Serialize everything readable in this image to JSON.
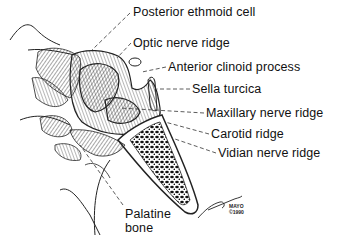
{
  "figure": {
    "labels": [
      {
        "id": "posterior-ethmoid-cell",
        "text": "Posterior ethmoid cell",
        "x": 133,
        "y": 6
      },
      {
        "id": "optic-nerve-ridge",
        "text": "Optic nerve ridge",
        "x": 133,
        "y": 37
      },
      {
        "id": "anterior-clinoid-process",
        "text": "Anterior clinoid process",
        "x": 168,
        "y": 61
      },
      {
        "id": "sella-turcica",
        "text": "Sella turcica",
        "x": 192,
        "y": 83
      },
      {
        "id": "maxillary-nerve-ridge",
        "text": "Maxillary nerve ridge",
        "x": 206,
        "y": 107
      },
      {
        "id": "carotid-ridge",
        "text": "Carotid ridge",
        "x": 211,
        "y": 128
      },
      {
        "id": "vidian-nerve-ridge",
        "text": "Vidian nerve ridge",
        "x": 218,
        "y": 147
      },
      {
        "id": "palatine-bone-1",
        "text": "Palatine",
        "x": 125,
        "y": 208
      },
      {
        "id": "palatine-bone-2",
        "text": "bone",
        "x": 125,
        "y": 222
      }
    ],
    "signature": {
      "artist": "Westmore",
      "mark1": "MAYO",
      "mark2": "©1990"
    }
  }
}
